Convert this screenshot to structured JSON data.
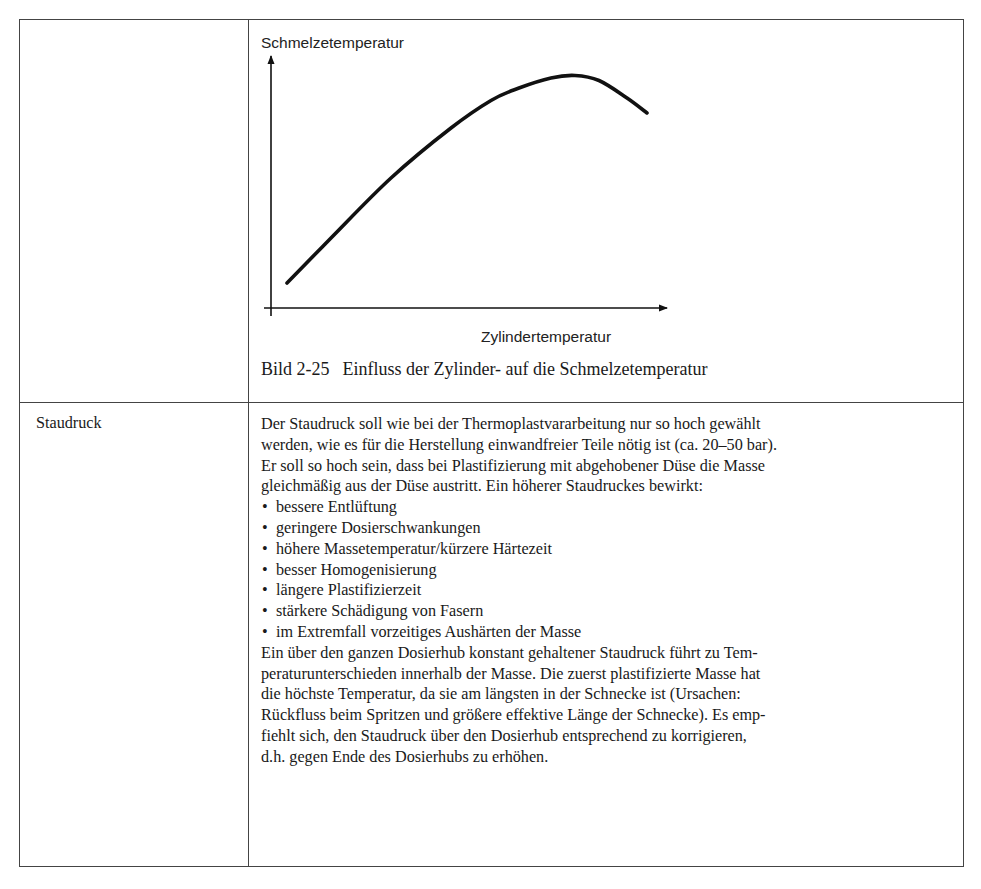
{
  "table": {
    "rows": [
      {
        "parameter": "",
        "figure": {
          "caption_number": "Bild 2-25",
          "caption_text": "Einfluss der Zylinder- auf die Schmelzetemperatur"
        }
      },
      {
        "parameter": "Staudruck",
        "description": {
          "intro_lines": [
            "Der Staudruck soll wie bei der Thermoplastvararbeitung nur so hoch gewählt",
            "werden, wie es für die Herstellung einwandfreier Teile nötig ist (ca. 20–50 bar).",
            "Er soll so hoch sein, dass bei Plastifizierung mit abgehobener Düse die Masse",
            "gleichmäßig aus der Düse austritt. Ein höherer Staudruckes bewirkt:"
          ],
          "bullet_symbol": "•",
          "bullets": [
            "bessere Entlüftung",
            "geringere Dosierschwankungen",
            "höhere Massetemperatur/kürzere Härtezeit",
            "besser Homogenisierung",
            "längere Plastifizierzeit",
            "stärkere Schädigung von Fasern",
            "im Extremfall vorzeitiges Aushärten der Masse"
          ],
          "outro_lines": [
            "Ein über den ganzen Dosierhub konstant gehaltener Staudruck führt zu Tem-",
            "peraturunterschieden innerhalb der Masse. Die zuerst plastifizierte Masse hat",
            "die höchste Temperatur, da sie am längsten in der Schnecke ist (Ursachen:",
            "Rückfluss beim Spritzen und größere effektive Länge der Schnecke). Es emp-",
            "fiehlt sich, den Staudruck über den Dosierhub entsprechend zu korrigieren,",
            "d.h. gegen Ende des Dosierhubs zu erhöhen."
          ]
        }
      }
    ]
  },
  "chart_data": {
    "type": "line",
    "xlabel": "Zylindertemperatur",
    "ylabel": "Schmelzetemperatur",
    "xlim": [
      0,
      100
    ],
    "ylim": [
      0,
      100
    ],
    "grid": false,
    "ticks": "none (qualitative axes)",
    "series": [
      {
        "name": "Schmelzetemperatur",
        "x": [
          4,
          15,
          30,
          45,
          55,
          62,
          70,
          76,
          82,
          89,
          94
        ],
        "y": [
          10,
          28,
          52,
          72,
          83,
          88,
          92,
          93,
          91,
          84,
          78
        ]
      }
    ]
  }
}
